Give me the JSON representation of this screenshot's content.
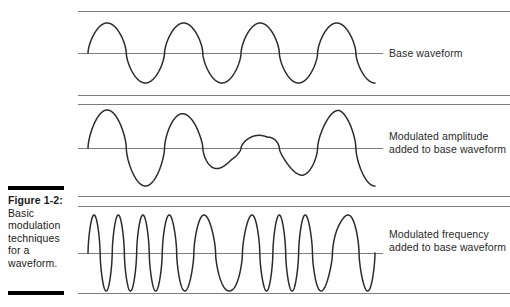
{
  "figure": {
    "caption_label": "Figure 1-2:",
    "caption_body": "Basic modulation techniques for a waveform.",
    "background_color": "#ffffff",
    "rule_color": "#7d7d7d",
    "caption_rule_color": "#000000",
    "wave_color": "#2b2b2b",
    "text_color": "#2a2a2a"
  },
  "annotations": {
    "base": "Base waveform",
    "amplitude": "Modulated amplitude added to base waveform",
    "frequency": "Modulated frequency added to base waveform"
  },
  "chart_data": {
    "type": "line",
    "title": "Basic modulation techniques for a waveform",
    "xlabel": "",
    "ylabel": "",
    "grid": false,
    "legend_position": "right",
    "panels": [
      {
        "name": "base-waveform",
        "label": "Base waveform",
        "modulation": "none",
        "baseline_y": 53,
        "top_rule_y": 11,
        "bottom_rule_y": 95,
        "x_start": 88,
        "x_end": 375,
        "amplitude": 30,
        "cycles": 3.75,
        "amplitude_envelope": [
          1,
          1,
          1,
          1,
          1,
          1,
          1,
          1,
          1
        ],
        "frequency_profile": [
          1,
          1,
          1,
          1,
          1,
          1,
          1,
          1,
          1
        ]
      },
      {
        "name": "amplitude-modulated-waveform",
        "label": "Modulated amplitude added to base waveform",
        "modulation": "amplitude",
        "baseline_y": 148,
        "top_rule_y": 104,
        "bottom_rule_y": 196,
        "x_start": 88,
        "x_end": 375,
        "amplitude": 38,
        "cycles": 3.75,
        "amplitude_envelope": [
          1.0,
          1.0,
          1.0,
          0.85,
          0.38,
          0.32,
          0.75,
          1.0,
          1.0
        ],
        "frequency_profile": [
          1,
          1,
          1,
          1,
          1,
          1,
          1,
          1,
          1
        ]
      },
      {
        "name": "frequency-modulated-waveform",
        "label": "Modulated frequency added to base waveform",
        "modulation": "frequency",
        "baseline_y": 253,
        "top_rule_y": 206,
        "bottom_rule_y": 293,
        "x_start": 88,
        "x_end": 375,
        "amplitude": 38,
        "cycles": 9,
        "amplitude_envelope": [
          1,
          1,
          1,
          1,
          1,
          1,
          1,
          1,
          1
        ],
        "frequency_profile": [
          2.6,
          2.6,
          2.4,
          1.6,
          1.0,
          2.5,
          2.4,
          0.85,
          2.3
        ]
      }
    ],
    "rules": [
      {
        "name": "panel1-top",
        "y": 11,
        "x1": 78,
        "x2": 510
      },
      {
        "name": "panel1-mid",
        "y": 53,
        "x1": 78,
        "x2": 383
      },
      {
        "name": "panel1-bottom",
        "y": 95,
        "x1": 78,
        "x2": 510
      },
      {
        "name": "panel2-top",
        "y": 104,
        "x1": 78,
        "x2": 510
      },
      {
        "name": "panel2-mid",
        "y": 148,
        "x1": 78,
        "x2": 383
      },
      {
        "name": "panel2-bottom",
        "y": 196,
        "x1": 78,
        "x2": 510
      },
      {
        "name": "panel3-top",
        "y": 206,
        "x1": 78,
        "x2": 510
      },
      {
        "name": "panel3-mid",
        "y": 253,
        "x1": 78,
        "x2": 383
      },
      {
        "name": "panel3-bottom",
        "y": 293,
        "x1": 78,
        "x2": 510
      }
    ]
  }
}
